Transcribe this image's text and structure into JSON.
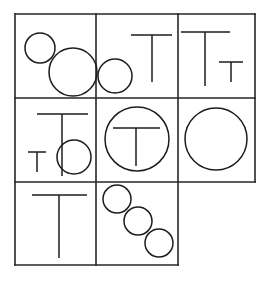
{
  "figure": {
    "background_color": "#ffffff",
    "line_color": "#1c1c1c",
    "grid_color": "#262626",
    "canvas": {
      "width": 268,
      "height": 282
    },
    "grid": {
      "columns_x": [
        15,
        96,
        178,
        255
      ],
      "rows_y": [
        14,
        98,
        182,
        265
      ],
      "note": "bottom row spans only the first two columns",
      "segments": [
        {
          "name": "outer-top",
          "x1": 15,
          "y1": 14,
          "x2": 255,
          "y2": 14
        },
        {
          "name": "row1-row2-divider",
          "x1": 15,
          "y1": 98,
          "x2": 255,
          "y2": 98
        },
        {
          "name": "row2-row3-divider",
          "x1": 15,
          "y1": 182,
          "x2": 255,
          "y2": 182
        },
        {
          "name": "outer-bottom",
          "x1": 15,
          "y1": 265,
          "x2": 178,
          "y2": 265
        },
        {
          "name": "outer-left",
          "x1": 15,
          "y1": 14,
          "x2": 15,
          "y2": 265
        },
        {
          "name": "col1-col2-divider",
          "x1": 96,
          "y1": 14,
          "x2": 96,
          "y2": 265
        },
        {
          "name": "col2-col3-divider",
          "x1": 178,
          "y1": 14,
          "x2": 178,
          "y2": 265
        },
        {
          "name": "outer-right",
          "x1": 255,
          "y1": 14,
          "x2": 255,
          "y2": 182
        }
      ]
    },
    "cells": [
      {
        "id": "cell-r1c1",
        "label": "row 1 column 1",
        "contents": "two circles",
        "circles": [
          {
            "name": "small-circle",
            "cx": 40,
            "cy": 48,
            "r": 15
          },
          {
            "name": "large-circle",
            "cx": 73,
            "cy": 72,
            "r": 24
          }
        ],
        "tees": []
      },
      {
        "id": "cell-r1c2",
        "label": "row 1 column 2",
        "contents": "one circle and one large T",
        "circles": [
          {
            "name": "circle",
            "cx": 115,
            "cy": 76,
            "r": 17
          }
        ],
        "tees": [
          {
            "name": "large-t",
            "bar_x1": 131,
            "bar_x2": 172,
            "bar_y": 35,
            "stem_x": 152,
            "stem_y2": 82
          }
        ]
      },
      {
        "id": "cell-r1c3",
        "label": "row 1 column 3",
        "contents": "one large T and one small T",
        "circles": [],
        "tees": [
          {
            "name": "large-t",
            "bar_x1": 181,
            "bar_x2": 230,
            "bar_y": 32,
            "stem_x": 205,
            "stem_y2": 86
          },
          {
            "name": "small-t",
            "bar_x1": 219,
            "bar_x2": 243,
            "bar_y": 62,
            "stem_x": 231,
            "stem_y2": 82
          }
        ]
      },
      {
        "id": "cell-r2c1",
        "label": "row 2 column 1",
        "contents": "one large T, one small T and one circle",
        "circles": [
          {
            "name": "circle",
            "cx": 74,
            "cy": 157,
            "r": 17
          }
        ],
        "tees": [
          {
            "name": "large-t",
            "bar_x1": 37,
            "bar_x2": 88,
            "bar_y": 114,
            "stem_x": 62,
            "stem_y2": 176
          },
          {
            "name": "small-t",
            "bar_x1": 28,
            "bar_x2": 46,
            "bar_y": 152,
            "stem_x": 37,
            "stem_y2": 172
          }
        ]
      },
      {
        "id": "cell-r2c2",
        "label": "row 2 column 2",
        "contents": "one large circle with a T inside",
        "circles": [
          {
            "name": "large-circle",
            "cx": 137,
            "cy": 139,
            "r": 32
          }
        ],
        "tees": [
          {
            "name": "large-t",
            "bar_x1": 113,
            "bar_x2": 160,
            "bar_y": 128,
            "stem_x": 136,
            "stem_y2": 166
          }
        ]
      },
      {
        "id": "cell-r2c3",
        "label": "row 2 column 3",
        "contents": "one large circle",
        "circles": [
          {
            "name": "large-circle",
            "cx": 216,
            "cy": 139,
            "r": 31
          }
        ],
        "tees": []
      },
      {
        "id": "cell-r3c1",
        "label": "row 3 column 1",
        "contents": "one large T",
        "circles": [],
        "tees": [
          {
            "name": "large-t",
            "bar_x1": 32,
            "bar_x2": 87,
            "bar_y": 195,
            "stem_x": 59,
            "stem_y2": 258
          }
        ]
      },
      {
        "id": "cell-r3c2",
        "label": "row 3 column 2",
        "contents": "three circles in a diagonal chain",
        "circles": [
          {
            "name": "circle-top",
            "cx": 117,
            "cy": 199,
            "r": 14
          },
          {
            "name": "circle-middle",
            "cx": 138,
            "cy": 221,
            "r": 14
          },
          {
            "name": "circle-bottom",
            "cx": 159,
            "cy": 243,
            "r": 14
          }
        ],
        "tees": []
      }
    ]
  }
}
